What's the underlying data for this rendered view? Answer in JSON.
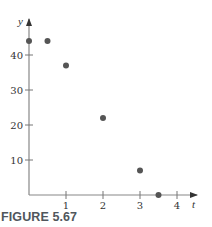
{
  "figure": {
    "caption": "FIGURE 5.67"
  },
  "chart_data": {
    "type": "scatter",
    "title": "",
    "xlabel": "t",
    "ylabel": "y",
    "x_ticks": [
      1,
      2,
      3,
      4
    ],
    "y_ticks": [
      10,
      20,
      30,
      40
    ],
    "xlim": [
      0,
      4.5
    ],
    "ylim": [
      0,
      48
    ],
    "grid": false,
    "legend": null,
    "points": [
      {
        "x": 0,
        "y": 44
      },
      {
        "x": 0.5,
        "y": 44
      },
      {
        "x": 1,
        "y": 37
      },
      {
        "x": 2,
        "y": 22
      },
      {
        "x": 3,
        "y": 7
      },
      {
        "x": 3.5,
        "y": 0
      }
    ],
    "point_color": "#555555",
    "axis_color": "#777777"
  }
}
